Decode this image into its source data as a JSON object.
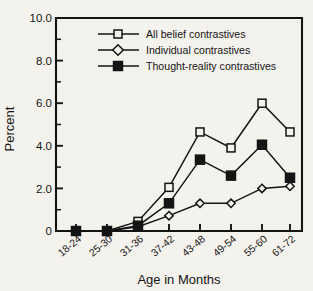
{
  "chart_data": {
    "type": "line",
    "title": "",
    "xlabel": "Age in Months",
    "ylabel": "Percent",
    "categories": [
      "18-24",
      "25-30",
      "31-36",
      "37-42",
      "43-48",
      "49-54",
      "55-60",
      "61-72"
    ],
    "series": [
      {
        "name": "All belief contrastives",
        "marker": "open-square",
        "values": [
          0,
          0,
          0.45,
          2.05,
          4.65,
          3.9,
          6.0,
          4.65
        ]
      },
      {
        "name": "Individual contrastives",
        "marker": "open-diamond",
        "values": [
          0,
          0,
          0.2,
          0.72,
          1.3,
          1.3,
          2.0,
          2.1
        ]
      },
      {
        "name": "Thought-reality contrastives",
        "marker": "filled-square",
        "values": [
          0,
          0,
          0.25,
          1.3,
          3.35,
          2.6,
          4.05,
          2.5
        ]
      }
    ],
    "ylim": [
      0,
      10
    ],
    "ytick_labels": [
      "0",
      "2.0",
      "4.0",
      "6.0",
      "8.0",
      "10.0"
    ],
    "ytick_values": [
      0,
      2,
      4,
      6,
      8,
      10
    ],
    "yminor_values": [
      1,
      3,
      5,
      7,
      9
    ],
    "grid": false,
    "legend_position": "top-center",
    "colors": {
      "ink": "#141414",
      "background": "#f4f2ed",
      "marker_fill_open": "#f4f2ed",
      "marker_fill_solid": "#141414"
    }
  }
}
